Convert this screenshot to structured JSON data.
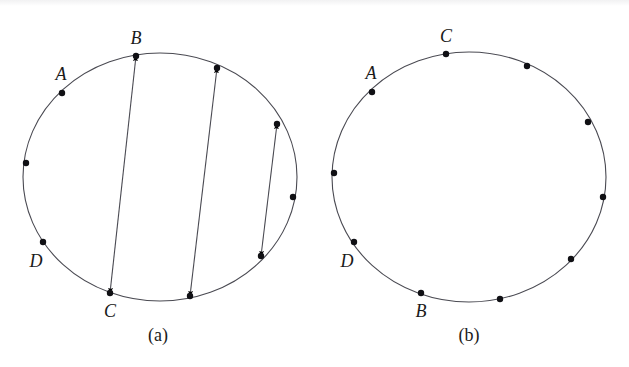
{
  "figure": {
    "background_color": "#ffffff",
    "line_color": "#4a4a52",
    "dot_color": "#101014",
    "text_color": "#1a1a1a",
    "circle_stroke_width": 1.1,
    "arrow_stroke_width": 1.1,
    "dot_radius": 3.2
  },
  "panels": [
    {
      "id": "panel-a",
      "caption": "(a)",
      "caption_x": 158,
      "caption_y": 341,
      "circle": {
        "cx": 160,
        "cy": 177,
        "rx": 137,
        "ry": 124
      },
      "vertices": [
        {
          "name": "vertex-b",
          "label": "B",
          "x": 136,
          "y": 56,
          "label_x": 136,
          "label_y": 44,
          "labeled": true
        },
        {
          "name": "vertex-a",
          "label": "A",
          "x": 62,
          "y": 93,
          "label_x": 61,
          "label_y": 80,
          "labeled": true
        },
        {
          "name": "vertex-w",
          "label": "",
          "x": 26,
          "y": 163,
          "label_x": 0,
          "label_y": 0,
          "labeled": false
        },
        {
          "name": "vertex-d",
          "label": "D",
          "x": 43,
          "y": 242,
          "label_x": 36,
          "label_y": 267,
          "labeled": true
        },
        {
          "name": "vertex-c",
          "label": "C",
          "x": 110,
          "y": 293,
          "label_x": 110,
          "label_y": 317,
          "labeled": true
        },
        {
          "name": "vertex-s",
          "label": "",
          "x": 190,
          "y": 296,
          "label_x": 0,
          "label_y": 0,
          "labeled": false
        },
        {
          "name": "vertex-se",
          "label": "",
          "x": 261,
          "y": 256,
          "label_x": 0,
          "label_y": 0,
          "labeled": false
        },
        {
          "name": "vertex-e",
          "label": "",
          "x": 293,
          "y": 197,
          "label_x": 0,
          "label_y": 0,
          "labeled": false
        },
        {
          "name": "vertex-ne",
          "label": "",
          "x": 277,
          "y": 124,
          "label_x": 0,
          "label_y": 0,
          "labeled": false
        },
        {
          "name": "vertex-nne",
          "label": "",
          "x": 217,
          "y": 68,
          "label_x": 0,
          "label_y": 0,
          "labeled": false
        }
      ],
      "arrows": [
        {
          "name": "arrow-b-c",
          "x1": 136,
          "y1": 56,
          "x2": 110,
          "y2": 293,
          "double_headed": true
        },
        {
          "name": "arrow-n-s",
          "x1": 217,
          "y1": 68,
          "x2": 190,
          "y2": 296,
          "double_headed": true
        },
        {
          "name": "arrow-ne-se",
          "x1": 277,
          "y1": 124,
          "x2": 261,
          "y2": 256,
          "double_headed": true
        }
      ]
    },
    {
      "id": "panel-b",
      "caption": "(b)",
      "caption_x": 469,
      "caption_y": 341,
      "circle": {
        "cx": 469,
        "cy": 177,
        "rx": 137,
        "ry": 125
      },
      "vertices": [
        {
          "name": "vertex-c",
          "label": "C",
          "x": 446,
          "y": 54,
          "label_x": 446,
          "label_y": 42,
          "labeled": true
        },
        {
          "name": "vertex-a",
          "label": "A",
          "x": 372,
          "y": 92,
          "label_x": 371,
          "label_y": 79,
          "labeled": true
        },
        {
          "name": "vertex-w",
          "label": "",
          "x": 334,
          "y": 173,
          "label_x": 0,
          "label_y": 0,
          "labeled": false
        },
        {
          "name": "vertex-d",
          "label": "D",
          "x": 354,
          "y": 242,
          "label_x": 347,
          "label_y": 267,
          "labeled": true
        },
        {
          "name": "vertex-b",
          "label": "B",
          "x": 421,
          "y": 293,
          "label_x": 421,
          "label_y": 317,
          "labeled": true
        },
        {
          "name": "vertex-s",
          "label": "",
          "x": 500,
          "y": 299,
          "label_x": 0,
          "label_y": 0,
          "labeled": false
        },
        {
          "name": "vertex-se",
          "label": "",
          "x": 571,
          "y": 259,
          "label_x": 0,
          "label_y": 0,
          "labeled": false
        },
        {
          "name": "vertex-e",
          "label": "",
          "x": 603,
          "y": 197,
          "label_x": 0,
          "label_y": 0,
          "labeled": false
        },
        {
          "name": "vertex-ne",
          "label": "",
          "x": 588,
          "y": 122,
          "label_x": 0,
          "label_y": 0,
          "labeled": false
        },
        {
          "name": "vertex-nne",
          "label": "",
          "x": 527,
          "y": 66,
          "label_x": 0,
          "label_y": 0,
          "labeled": false
        }
      ],
      "arrows": []
    }
  ]
}
